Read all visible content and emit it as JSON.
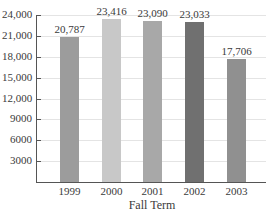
{
  "chart_data": {
    "type": "bar",
    "title": "",
    "xlabel": "Fall Term",
    "ylabel": "",
    "categories": [
      "1999",
      "2000",
      "2001",
      "2002",
      "2003"
    ],
    "values": [
      20787,
      23416,
      23090,
      23033,
      17706
    ],
    "value_labels": [
      "20,787",
      "23,416",
      "23,090",
      "23,033",
      "17,706"
    ],
    "bar_colors": [
      "#9c9c9c",
      "#c8c8c8",
      "#a8a8a8",
      "#707070",
      "#909090"
    ],
    "ylim": [
      0,
      24000
    ],
    "yticks": [
      3000,
      6000,
      9000,
      12000,
      15000,
      18000,
      21000,
      24000
    ],
    "ytick_labels": [
      "3000",
      "6000",
      "9000",
      "12,000",
      "15,000",
      "18,000",
      "21,000",
      "24,000"
    ],
    "grid": true,
    "legend": null
  }
}
